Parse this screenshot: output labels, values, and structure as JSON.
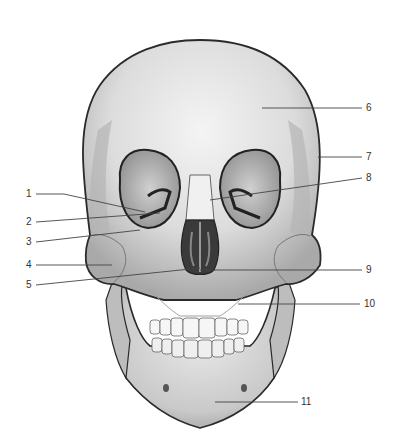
{
  "figure": {
    "labels": [
      {
        "id": 1,
        "text": "1",
        "x": 26,
        "y": 189
      },
      {
        "id": 2,
        "text": "2",
        "x": 26,
        "y": 217
      },
      {
        "id": 3,
        "text": "3",
        "x": 26,
        "y": 237
      },
      {
        "id": 4,
        "text": "4",
        "x": 26,
        "y": 262
      },
      {
        "id": 5,
        "text": "5",
        "x": 26,
        "y": 281
      },
      {
        "id": 6,
        "text": "6",
        "x": 366,
        "y": 104
      },
      {
        "id": 7,
        "text": "7",
        "x": 366,
        "y": 153
      },
      {
        "id": 8,
        "text": "8",
        "x": 366,
        "y": 174
      },
      {
        "id": 9,
        "text": "9",
        "x": 366,
        "y": 266
      },
      {
        "id": 10,
        "text": "10",
        "x": 364,
        "y": 300
      },
      {
        "id": 11,
        "text": "11",
        "x": 301,
        "y": 398
      }
    ],
    "colors": {
      "bone_light": "#efefef",
      "bone_mid": "#cfcfcf",
      "bone_shadow": "#8a8a8a",
      "outline": "#2a2a2a",
      "leader": "#444444",
      "cavity": "#3a3a3a"
    }
  }
}
